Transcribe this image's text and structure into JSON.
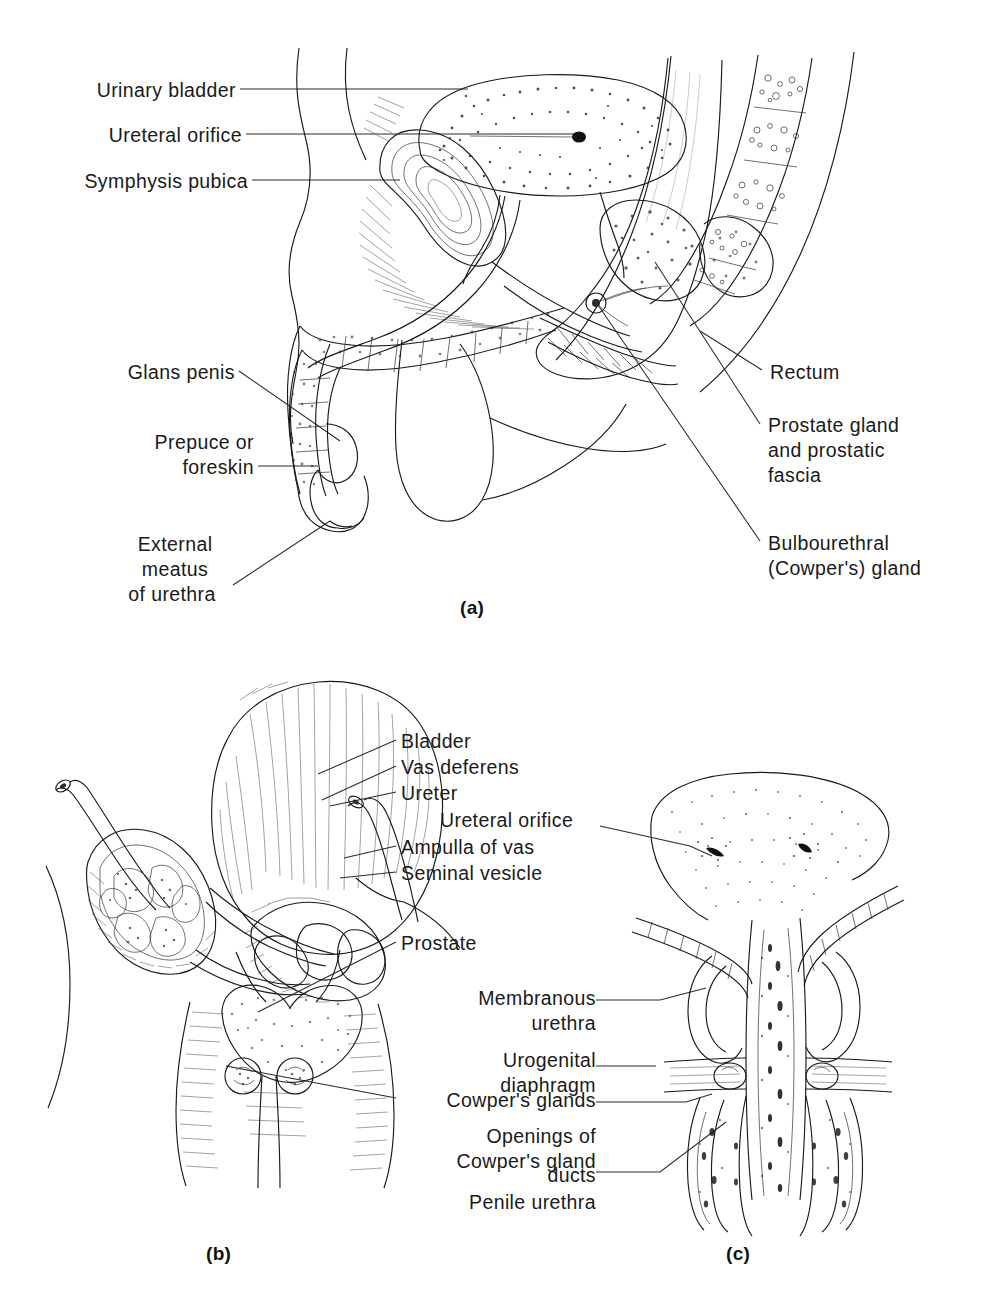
{
  "figure": {
    "background_color": "#ffffff",
    "ink_color": "#1a1a1a"
  },
  "panels": [
    {
      "id": "a",
      "caption": "(a)",
      "description": "Midsagittal section of the male pelvis",
      "labels": [
        {
          "id": "urinary-bladder",
          "text": "Urinary bladder",
          "align": "right"
        },
        {
          "id": "ureteral-orifice",
          "text": "Ureteral orifice",
          "align": "right"
        },
        {
          "id": "symphysis-pubica",
          "text": "Symphysis pubica",
          "align": "right"
        },
        {
          "id": "glans-penis",
          "text": "Glans penis",
          "align": "right"
        },
        {
          "id": "prepuce",
          "text": "Prepuce or\nforeskin",
          "align": "right"
        },
        {
          "id": "external-meatus",
          "text": "External\nmeatus\nof urethra",
          "align": "center"
        },
        {
          "id": "rectum",
          "text": "Rectum",
          "align": "left"
        },
        {
          "id": "prostate-gland",
          "text": "Prostate gland\nand prostatic\nfascia",
          "align": "left"
        },
        {
          "id": "bulbourethral",
          "text": "Bulbourethral\n(Cowper's) gland",
          "align": "left"
        }
      ]
    },
    {
      "id": "b",
      "caption": "(b)",
      "description": "Posterior view of bladder, seminal vesicles and prostate",
      "labels": [
        {
          "id": "bladder",
          "text": "Bladder",
          "align": "left"
        },
        {
          "id": "vas-deferens",
          "text": "Vas deferens",
          "align": "left"
        },
        {
          "id": "ureter",
          "text": "Ureter",
          "align": "left"
        },
        {
          "id": "ampulla-of-vas",
          "text": "Ampulla of vas",
          "align": "left"
        },
        {
          "id": "seminal-vesicle",
          "text": "Seminal vesicle",
          "align": "left"
        },
        {
          "id": "prostate",
          "text": "Prostate",
          "align": "left"
        },
        {
          "id": "cowpers-glands",
          "text": "Cowper's glands",
          "align": "left"
        }
      ]
    },
    {
      "id": "c",
      "caption": "(c)",
      "description": "Coronal section of prostate and urethra",
      "labels": [
        {
          "id": "ureteral-orifice-c",
          "text": "Ureteral orifice",
          "align": "right"
        },
        {
          "id": "membranous-urethra",
          "text": "Membranous\nurethra",
          "align": "right"
        },
        {
          "id": "urogenital-diaphragm",
          "text": "Urogenital\ndiaphragm",
          "align": "right"
        },
        {
          "id": "openings-cowpers",
          "text": "Openings of\nCowper's gland\nducts",
          "align": "right"
        },
        {
          "id": "penile-urethra",
          "text": "Penile urethra",
          "align": "right"
        }
      ]
    }
  ],
  "label_text": {
    "urinary_bladder": "Urinary bladder",
    "ureteral_orifice": "Ureteral orifice",
    "symphysis_pubica": "Symphysis pubica",
    "glans_penis": "Glans penis",
    "prepuce_line1": "Prepuce or",
    "prepuce_line2": "foreskin",
    "external_line1": "External",
    "external_line2": "meatus",
    "external_line3": "of urethra",
    "rectum": "Rectum",
    "prostate_gland_line1": "Prostate gland",
    "prostate_gland_line2": "and prostatic",
    "prostate_gland_line3": "fascia",
    "bulbourethral_line1": "Bulbourethral",
    "bulbourethral_line2": "(Cowper's) gland",
    "bladder": "Bladder",
    "vas_deferens": "Vas deferens",
    "ureter": "Ureter",
    "ureteral_orifice_c": "Ureteral orifice",
    "ampulla_of_vas": "Ampulla of vas",
    "seminal_vesicle": "Seminal vesicle",
    "prostate": "Prostate",
    "membranous_line1": "Membranous",
    "membranous_line2": "urethra",
    "urogenital_line1": "Urogenital",
    "urogenital_line2": "diaphragm",
    "cowpers_glands": "Cowper's glands",
    "openings_line1": "Openings of",
    "openings_line2": "Cowper's gland",
    "openings_line3": "ducts",
    "penile_urethra": "Penile urethra",
    "caption_a": "(a)",
    "caption_b": "(b)",
    "caption_c": "(c)"
  }
}
